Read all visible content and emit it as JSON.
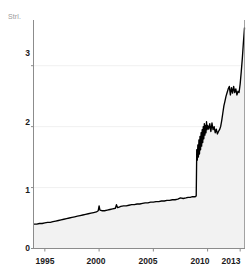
{
  "chart_data": {
    "type": "area",
    "title": "",
    "subtitle": "",
    "xlabel": "",
    "ylabel": "",
    "unit_label": "Strl.",
    "grid": true,
    "legend": null,
    "xlim": [
      1994.0,
      2013.4
    ],
    "ylim": [
      0,
      3.75
    ],
    "yticks": [
      0,
      1,
      2,
      3
    ],
    "ytick_labels": [
      "0",
      "1",
      "2",
      "3"
    ],
    "xticks": [
      1995,
      2000,
      2005,
      2010,
      2013
    ],
    "xtick_labels": [
      "1995",
      "2000",
      "2005",
      "2010",
      "2013"
    ],
    "line_color": "#000000",
    "fill_color": "#f2f2f2",
    "axis_color": "#8c8c8c",
    "grid_color": "#f0f0f0",
    "series": [
      {
        "name": "value",
        "x": [
          1994.0,
          1994.25,
          1994.5,
          1994.75,
          1995.0,
          1995.25,
          1995.5,
          1995.75,
          1996.0,
          1996.25,
          1996.5,
          1996.75,
          1997.0,
          1997.25,
          1997.5,
          1997.75,
          1998.0,
          1998.25,
          1998.5,
          1998.75,
          1999.0,
          1999.25,
          1999.5,
          1999.75,
          1999.92,
          2000.0,
          2000.08,
          2000.25,
          2000.5,
          2000.75,
          2001.0,
          2001.25,
          2001.5,
          2001.6,
          2001.7,
          2001.85,
          2002.0,
          2002.25,
          2002.5,
          2002.75,
          2003.0,
          2003.25,
          2003.5,
          2003.75,
          2004.0,
          2004.25,
          2004.5,
          2004.75,
          2005.0,
          2005.25,
          2005.5,
          2005.75,
          2006.0,
          2006.25,
          2006.5,
          2006.75,
          2007.0,
          2007.25,
          2007.5,
          2007.75,
          2008.0,
          2008.2,
          2008.4,
          2008.6,
          2008.75,
          2008.85,
          2008.9,
          2008.95,
          2009.0,
          2009.05,
          2009.1,
          2009.15,
          2009.2,
          2009.25,
          2009.3,
          2009.35,
          2009.4,
          2009.45,
          2009.5,
          2009.55,
          2009.6,
          2009.65,
          2009.7,
          2009.75,
          2009.8,
          2009.85,
          2009.9,
          2009.95,
          2010.0,
          2010.1,
          2010.2,
          2010.3,
          2010.4,
          2010.5,
          2010.6,
          2010.7,
          2010.8,
          2010.9,
          2011.0,
          2011.1,
          2011.2,
          2011.3,
          2011.4,
          2011.5,
          2011.6,
          2011.7,
          2011.8,
          2011.9,
          2012.0,
          2012.1,
          2012.2,
          2012.3,
          2012.4,
          2012.5,
          2012.6,
          2012.7,
          2012.8,
          2012.9,
          2013.0,
          2013.1,
          2013.2,
          2013.3,
          2013.4
        ],
        "y": [
          0.4,
          0.4,
          0.41,
          0.41,
          0.42,
          0.43,
          0.43,
          0.44,
          0.45,
          0.46,
          0.47,
          0.48,
          0.49,
          0.5,
          0.51,
          0.52,
          0.53,
          0.54,
          0.55,
          0.56,
          0.57,
          0.58,
          0.59,
          0.6,
          0.62,
          0.7,
          0.63,
          0.62,
          0.62,
          0.63,
          0.64,
          0.65,
          0.66,
          0.72,
          0.67,
          0.68,
          0.69,
          0.7,
          0.7,
          0.71,
          0.72,
          0.72,
          0.73,
          0.73,
          0.74,
          0.75,
          0.75,
          0.76,
          0.76,
          0.77,
          0.77,
          0.78,
          0.78,
          0.79,
          0.79,
          0.8,
          0.8,
          0.81,
          0.83,
          0.82,
          0.83,
          0.84,
          0.84,
          0.85,
          0.85,
          0.85,
          0.86,
          0.86,
          1.62,
          1.45,
          1.7,
          1.5,
          1.78,
          1.55,
          1.84,
          1.62,
          1.9,
          1.68,
          1.95,
          1.74,
          2.0,
          1.8,
          2.05,
          1.86,
          2.02,
          1.9,
          2.08,
          1.95,
          2.02,
          1.96,
          2.05,
          1.92,
          2.06,
          1.95,
          2.0,
          1.9,
          1.96,
          1.88,
          1.92,
          1.95,
          2.0,
          2.1,
          2.22,
          2.34,
          2.42,
          2.5,
          2.56,
          2.62,
          2.66,
          2.52,
          2.64,
          2.55,
          2.66,
          2.56,
          2.62,
          2.52,
          2.58,
          2.56,
          2.7,
          2.9,
          3.12,
          3.38,
          3.62
        ]
      }
    ],
    "annotations": [
      {
        "text": "sharp step increase",
        "x": 2009.0,
        "y": 1.62
      }
    ]
  },
  "axis": {
    "unit_label": "Strl.",
    "ytick_labels": [
      "3",
      "2",
      "1",
      "0"
    ],
    "xtick_labels": [
      "1995",
      "2000",
      "2005",
      "2010",
      "2013"
    ]
  }
}
